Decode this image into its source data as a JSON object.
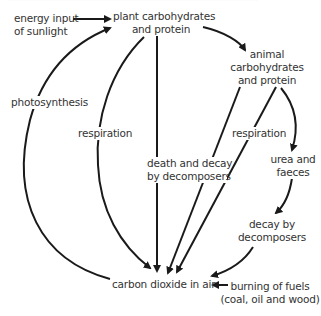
{
  "diagram": {
    "title_clipped": true,
    "nodes": {
      "sunlight": {
        "line1": "energy input",
        "line2": "of sunlight"
      },
      "plant": {
        "line1": "plant carbohydrates",
        "line2": "and protein"
      },
      "animal": {
        "line1": "animal",
        "line2": "carbohydrates",
        "line3": "and protein"
      },
      "urea": {
        "line1": "urea and",
        "line2": "faeces"
      },
      "co2": {
        "line1": "carbon dioxide in air"
      },
      "fuels": {
        "line1": "burning of fuels",
        "line2": "(coal, oil and wood)"
      }
    },
    "edge_labels": {
      "photosynthesis": "photosynthesis",
      "plant_respiration": "respiration",
      "animal_respiration": "respiration",
      "death_decay_1": "death and decay",
      "death_decay_2": "by decomposers",
      "decay_1": "decay by",
      "decay_2": "decomposers"
    },
    "edges": [
      {
        "from": "energy input of sunlight",
        "to": "plant carbohydrates and protein"
      },
      {
        "from": "carbon dioxide in air",
        "to": "plant carbohydrates and protein",
        "label": "photosynthesis"
      },
      {
        "from": "plant carbohydrates and protein",
        "to": "animal carbohydrates and protein"
      },
      {
        "from": "plant carbohydrates and protein",
        "to": "carbon dioxide in air",
        "label": "respiration"
      },
      {
        "from": "plant carbohydrates and protein",
        "to": "carbon dioxide in air",
        "label": "death and decay by decomposers"
      },
      {
        "from": "animal carbohydrates and protein",
        "to": "carbon dioxide in air",
        "label": "death and decay by decomposers"
      },
      {
        "from": "animal carbohydrates and protein",
        "to": "carbon dioxide in air",
        "label": "respiration"
      },
      {
        "from": "animal carbohydrates and protein",
        "to": "urea and faeces"
      },
      {
        "from": "urea and faeces",
        "to": "carbon dioxide in air",
        "label": "decay by decomposers"
      },
      {
        "from": "burning of fuels (coal, oil and wood)",
        "to": "carbon dioxide in air"
      }
    ],
    "colors": {
      "line": "#1a1a1a",
      "text": "#333333",
      "background": "#ffffff"
    }
  }
}
